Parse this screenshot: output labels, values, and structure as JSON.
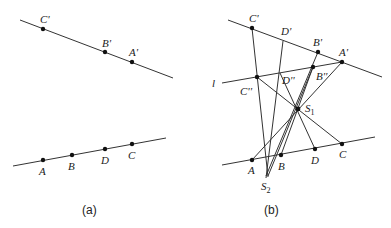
{
  "panels": [
    {
      "caption": "(a)",
      "points": {
        "C_prime": "C'",
        "B_prime": "B'",
        "A_prime": "A'",
        "A": "A",
        "B": "B",
        "D": "D",
        "C": "C"
      }
    },
    {
      "caption": "(b)",
      "points": {
        "C_prime": "C'",
        "D_prime": "D'",
        "B_prime": "B'",
        "A_prime": "A'",
        "l": "l",
        "C_dprime": "C''",
        "D_dprime": "D''",
        "B_dprime": "B''",
        "S1": "S",
        "S1_sub": "1",
        "A": "A",
        "B": "B",
        "D": "D",
        "C": "C",
        "S2": "S",
        "S2_sub": "2"
      }
    }
  ]
}
